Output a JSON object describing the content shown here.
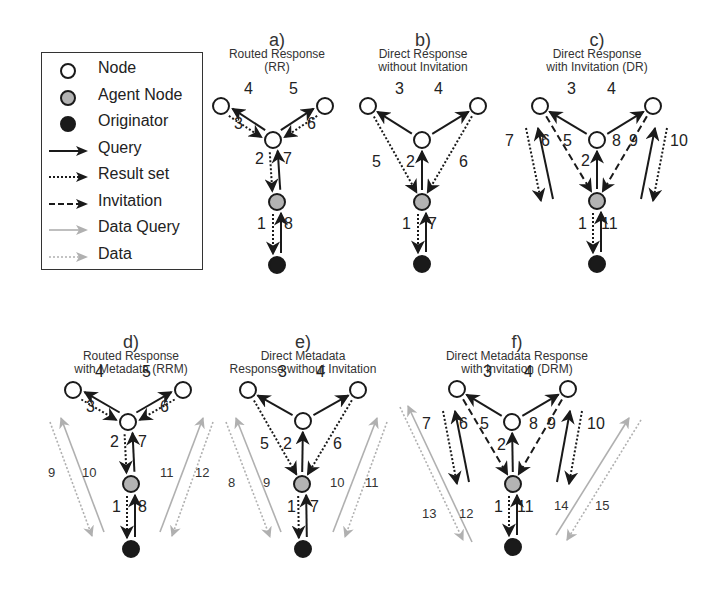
{
  "legend": {
    "items": [
      {
        "label": "Node",
        "symbol": "node-open",
        "icon": "open-circle-icon"
      },
      {
        "label": "Agent Node",
        "symbol": "node-agent",
        "icon": "gray-circle-icon"
      },
      {
        "label": "Originator",
        "symbol": "node-originator",
        "icon": "filled-circle-icon"
      },
      {
        "label": "Query",
        "symbol": "arrow-solid",
        "icon": "solid-arrow-icon"
      },
      {
        "label": "Result set",
        "symbol": "arrow-dotted",
        "icon": "dotted-arrow-icon"
      },
      {
        "label": "Invitation",
        "symbol": "arrow-dashed",
        "icon": "dashed-arrow-icon"
      },
      {
        "label": "Data Query",
        "symbol": "arrow-gray-solid",
        "icon": "gray-solid-arrow-icon"
      },
      {
        "label": "Data",
        "symbol": "arrow-gray-dotted",
        "icon": "gray-dotted-arrow-icon"
      }
    ]
  },
  "colors": {
    "black": "#1a1a1a",
    "agent_fill": "#b3b3b3",
    "gray_line": "#b0b0b0",
    "background": "#ffffff"
  },
  "panels": [
    {
      "id": "a",
      "letter": "a)",
      "title_lines": [
        "Routed Response",
        "(RR)"
      ],
      "title_x": 277,
      "title_y": 32,
      "nodes": {
        "left": [
          221,
          106
        ],
        "center": [
          273,
          140
        ],
        "right": [
          325,
          106
        ],
        "agent": [
          277,
          202
        ],
        "orig": [
          277,
          265
        ]
      },
      "labels": [
        {
          "t": "4",
          "x": 246,
          "y": 90
        },
        {
          "t": "3",
          "x": 236,
          "y": 125
        },
        {
          "t": "5",
          "x": 291,
          "y": 90
        },
        {
          "t": "6",
          "x": 309,
          "y": 125
        },
        {
          "t": "2",
          "x": 257,
          "y": 160
        },
        {
          "t": "7",
          "x": 285,
          "y": 160
        },
        {
          "t": "1",
          "x": 259,
          "y": 225
        },
        {
          "t": "8",
          "x": 286,
          "y": 225
        }
      ]
    },
    {
      "id": "b",
      "letter": "b)",
      "title_lines": [
        "Direct Response",
        "without Invitation"
      ],
      "title_x": 423,
      "title_y": 32,
      "nodes": {
        "left": [
          368,
          106
        ],
        "center": [
          422,
          140
        ],
        "right": [
          478,
          106
        ],
        "agent": [
          422,
          202
        ],
        "orig": [
          422,
          264
        ]
      },
      "labels": [
        {
          "t": "3",
          "x": 397,
          "y": 90
        },
        {
          "t": "4",
          "x": 436,
          "y": 90
        },
        {
          "t": "5",
          "x": 374,
          "y": 163
        },
        {
          "t": "2",
          "x": 408,
          "y": 163
        },
        {
          "t": "6",
          "x": 461,
          "y": 163
        },
        {
          "t": "1",
          "x": 404,
          "y": 225
        },
        {
          "t": "7",
          "x": 430,
          "y": 225
        }
      ]
    },
    {
      "id": "c",
      "letter": "c)",
      "title_lines": [
        "Direct Response",
        "with Invitation (DR)"
      ],
      "title_x": 597,
      "title_y": 32,
      "nodes": {
        "left": [
          540,
          106
        ],
        "center": [
          597,
          140
        ],
        "right": [
          653,
          106
        ],
        "agent": [
          597,
          201
        ],
        "orig": [
          597,
          264
        ]
      },
      "labels": [
        {
          "t": "7",
          "x": 507,
          "y": 142
        },
        {
          "t": "6",
          "x": 543,
          "y": 142
        },
        {
          "t": "5",
          "x": 565,
          "y": 142
        },
        {
          "t": "3",
          "x": 569,
          "y": 90
        },
        {
          "t": "4",
          "x": 609,
          "y": 90
        },
        {
          "t": "8",
          "x": 614,
          "y": 142
        },
        {
          "t": "9",
          "x": 631,
          "y": 142
        },
        {
          "t": "10",
          "x": 672,
          "y": 142
        },
        {
          "t": "2",
          "x": 583,
          "y": 162
        },
        {
          "t": "1",
          "x": 580,
          "y": 225
        },
        {
          "t": "11",
          "x": 603,
          "y": 225
        }
      ]
    },
    {
      "id": "d",
      "letter": "d)",
      "title_lines": [
        "Routed Response",
        "with Metadata (RRM)"
      ],
      "title_x": 131,
      "title_y": 334,
      "nodes": {
        "left": [
          73,
          390
        ],
        "center": [
          128,
          422
        ],
        "right": [
          183,
          390
        ],
        "agent": [
          131,
          484
        ],
        "orig": [
          131,
          549
        ]
      },
      "labels": [
        {
          "t": "4",
          "x": 97,
          "y": 373
        },
        {
          "t": "3",
          "x": 88,
          "y": 408
        },
        {
          "t": "5",
          "x": 144,
          "y": 373
        },
        {
          "t": "6",
          "x": 162,
          "y": 408
        },
        {
          "t": "2",
          "x": 112,
          "y": 443
        },
        {
          "t": "7",
          "x": 140,
          "y": 443
        },
        {
          "t": "1",
          "x": 114,
          "y": 508
        },
        {
          "t": "8",
          "x": 140,
          "y": 508
        }
      ],
      "gray_labels": [
        {
          "t": "9",
          "x": 50,
          "y": 473
        },
        {
          "t": "10",
          "x": 84,
          "y": 473
        },
        {
          "t": "11",
          "x": 162,
          "y": 473
        },
        {
          "t": "12",
          "x": 197,
          "y": 473
        }
      ],
      "gray_arrows": {
        "left_dotted": [
          [
            50,
            422
          ],
          [
            92,
            536
          ]
        ],
        "left_solid": [
          [
            104,
            532
          ],
          [
            61,
            418
          ]
        ],
        "right_solid": [
          [
            160,
            532
          ],
          [
            203,
            418
          ]
        ],
        "right_dotted": [
          [
            213,
            422
          ],
          [
            172,
            536
          ]
        ]
      }
    },
    {
      "id": "e",
      "letter": "e)",
      "title_lines": [
        "Direct Metadata",
        "Response without Invitation"
      ],
      "title_x": 303,
      "title_y": 334,
      "nodes": {
        "left": [
          248,
          390
        ],
        "center": [
          303,
          421
        ],
        "right": [
          358,
          390
        ],
        "agent": [
          302,
          484
        ],
        "orig": [
          303,
          549
        ]
      },
      "labels": [
        {
          "t": "3",
          "x": 280,
          "y": 373
        },
        {
          "t": "4",
          "x": 318,
          "y": 373
        },
        {
          "t": "5",
          "x": 262,
          "y": 445
        },
        {
          "t": "2",
          "x": 285,
          "y": 445
        },
        {
          "t": "6",
          "x": 335,
          "y": 445
        },
        {
          "t": "1",
          "x": 289,
          "y": 508
        },
        {
          "t": "7",
          "x": 312,
          "y": 508
        }
      ],
      "gray_labels": [
        {
          "t": "8",
          "x": 230,
          "y": 483
        },
        {
          "t": "9",
          "x": 265,
          "y": 483
        },
        {
          "t": "10",
          "x": 332,
          "y": 483
        },
        {
          "t": "11",
          "x": 367,
          "y": 483
        }
      ],
      "gray_arrows": {
        "left_dotted": [
          [
            226,
            422
          ],
          [
            270,
            537
          ]
        ],
        "left_solid": [
          [
            281,
            532
          ],
          [
            236,
            418
          ]
        ],
        "right_solid": [
          [
            333,
            532
          ],
          [
            377,
            418
          ]
        ],
        "right_dotted": [
          [
            387,
            422
          ],
          [
            345,
            537
          ]
        ]
      }
    },
    {
      "id": "f",
      "letter": "f)",
      "title_lines": [
        "Direct Metadata Response",
        "with Invitation (DRM)"
      ],
      "title_x": 517,
      "title_y": 334,
      "nodes": {
        "left": [
          457,
          389
        ],
        "center": [
          512,
          422
        ],
        "right": [
          568,
          389
        ],
        "agent": [
          513,
          484
        ],
        "orig": [
          513,
          547
        ]
      },
      "labels": [
        {
          "t": "7",
          "x": 424,
          "y": 425
        },
        {
          "t": "6",
          "x": 461,
          "y": 425
        },
        {
          "t": "5",
          "x": 482,
          "y": 425
        },
        {
          "t": "3",
          "x": 485,
          "y": 373
        },
        {
          "t": "4",
          "x": 526,
          "y": 373
        },
        {
          "t": "8",
          "x": 531,
          "y": 425
        },
        {
          "t": "9",
          "x": 549,
          "y": 425
        },
        {
          "t": "10",
          "x": 589,
          "y": 425
        },
        {
          "t": "2",
          "x": 499,
          "y": 446
        },
        {
          "t": "1",
          "x": 496,
          "y": 508
        },
        {
          "t": "11",
          "x": 519,
          "y": 508
        }
      ],
      "gray_labels": [
        {
          "t": "13",
          "x": 424,
          "y": 514
        },
        {
          "t": "12",
          "x": 461,
          "y": 514
        },
        {
          "t": "14",
          "x": 556,
          "y": 506
        },
        {
          "t": "15",
          "x": 597,
          "y": 506
        }
      ],
      "gray_arrows": {
        "left_dotted": [
          [
            400,
            407
          ],
          [
            463,
            540
          ]
        ],
        "left_solid": [
          [
            472,
            542
          ],
          [
            408,
            406
          ]
        ],
        "right_solid": [
          [
            556,
            535
          ],
          [
            629,
            418
          ]
        ],
        "right_dotted": [
          [
            641,
            420
          ],
          [
            567,
            540
          ]
        ]
      }
    }
  ]
}
